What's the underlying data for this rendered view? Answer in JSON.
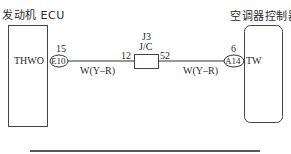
{
  "diagram": {
    "left_component": {
      "title": "发动机 ECU",
      "terminal": "THWO",
      "connector": "E10",
      "pin": "15"
    },
    "right_component": {
      "title": "空调器控制器",
      "terminal": "TW",
      "connector": "A14",
      "pin": "6"
    },
    "junction": {
      "id": "J3",
      "name": "J/C",
      "pin_left": "12",
      "pin_right": "52"
    },
    "wires": [
      {
        "color_label": "W(Y–R)"
      },
      {
        "color_label": "W(Y–R)"
      }
    ],
    "colors": {
      "line": "#3a3a3a",
      "background": "#ffffff"
    }
  }
}
